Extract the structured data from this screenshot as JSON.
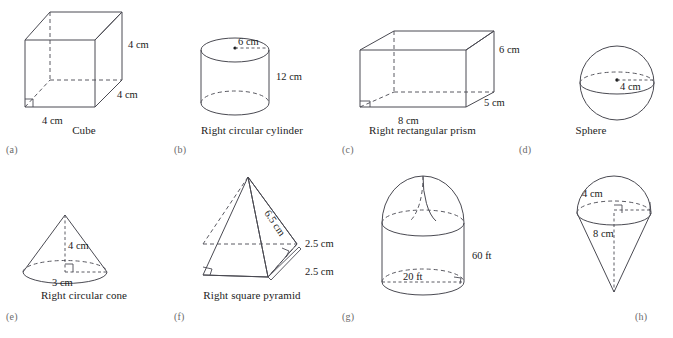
{
  "figure": {
    "units_cm": "cm",
    "units_ft": "ft",
    "panels": [
      {
        "key": "a",
        "sublabel": "(a)",
        "caption": "Cube",
        "shape": "cube",
        "labels": {
          "width": "4 cm",
          "depth": "4 cm",
          "height": "4 cm"
        }
      },
      {
        "key": "b",
        "sublabel": "(b)",
        "caption": "Right circular cylinder",
        "shape": "cylinder",
        "labels": {
          "radius": "6 cm",
          "height": "12 cm"
        }
      },
      {
        "key": "c",
        "sublabel": "(c)",
        "caption": "Right rectangular prism",
        "shape": "rectangular-prism",
        "labels": {
          "length": "8 cm",
          "depth": "5 cm",
          "height": "6 cm"
        }
      },
      {
        "key": "d",
        "sublabel": "(d)",
        "caption": "Sphere",
        "shape": "sphere",
        "labels": {
          "radius": "4 cm"
        }
      },
      {
        "key": "e",
        "sublabel": "(e)",
        "caption": "Right circular cone",
        "shape": "cone",
        "labels": {
          "height": "4 cm",
          "radius": "3 cm"
        }
      },
      {
        "key": "f",
        "sublabel": "(f)",
        "caption": "Right square pyramid",
        "shape": "square-pyramid",
        "labels": {
          "slant": "6.5 cm",
          "side_upper": "2.5 cm",
          "side_lower": "2.5 cm"
        }
      },
      {
        "key": "g",
        "sublabel": "(g)",
        "caption": "",
        "shape": "cylinder-with-dome",
        "labels": {
          "height": "60 ft",
          "radius": "20 ft"
        }
      },
      {
        "key": "h",
        "sublabel": "(h)",
        "caption": "",
        "shape": "cone-with-hemisphere",
        "labels": {
          "radius": "4 cm",
          "height": "8 cm"
        }
      }
    ]
  },
  "colors": {
    "stroke": "#4a4a52",
    "hidden_stroke": "#5a5a62",
    "text": "#1a1a1a",
    "sublabel": "#6a6a6a",
    "background": "#ffffff"
  }
}
